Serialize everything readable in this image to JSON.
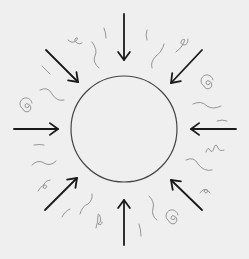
{
  "diagram": {
    "background": "#efefef",
    "center_circle": {
      "cx": 124,
      "cy": 129,
      "r": 53,
      "stroke": "#444444"
    },
    "arrow_color": "#1a1a1a",
    "squiggle_color": "#8a8a8a",
    "arrows": [
      {
        "name": "top",
        "x1": 124,
        "y1": 14,
        "x2": 124,
        "y2": 60
      },
      {
        "name": "top-right",
        "x1": 202,
        "y1": 50,
        "x2": 171,
        "y2": 83
      },
      {
        "name": "right",
        "x1": 236,
        "y1": 129,
        "x2": 191,
        "y2": 129
      },
      {
        "name": "bottom-right",
        "x1": 202,
        "y1": 210,
        "x2": 171,
        "y2": 180
      },
      {
        "name": "bottom",
        "x1": 124,
        "y1": 245,
        "x2": 124,
        "y2": 200
      },
      {
        "name": "bottom-left",
        "x1": 45,
        "y1": 210,
        "x2": 77,
        "y2": 178
      },
      {
        "name": "left",
        "x1": 14,
        "y1": 129,
        "x2": 58,
        "y2": 129
      },
      {
        "name": "top-left",
        "x1": 46,
        "y1": 50,
        "x2": 78,
        "y2": 82
      }
    ]
  }
}
